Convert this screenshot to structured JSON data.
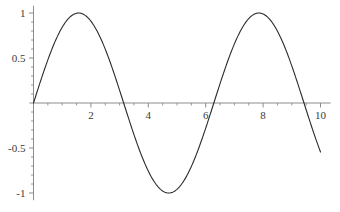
{
  "chart_data": {
    "type": "line",
    "title": "",
    "subtitle": "",
    "xlabel": "",
    "ylabel": "",
    "function": "sin(x)",
    "grid": false,
    "legend": false,
    "legend_position": "none",
    "axis_style": "crossing-at-origin",
    "xlim": [
      0,
      10.35
    ],
    "ylim": [
      -1.08,
      1.08
    ],
    "x_major_ticks": [
      2,
      4,
      6,
      8,
      10
    ],
    "x_major_tick_labels": [
      "2",
      "4",
      "6",
      "8",
      "10"
    ],
    "x_minor_tick_step": 0.5,
    "y_major_ticks": [
      1,
      0.5,
      -0.5,
      -1
    ],
    "y_major_tick_labels": [
      "1",
      "0.5",
      "-0.5",
      "-1"
    ],
    "y_minor_tick_step": 0.1,
    "series": [
      {
        "name": "sin(x)",
        "color": "#2b2b2b",
        "line_width": 1.1,
        "x": [
          0.0,
          0.2,
          0.4,
          0.6,
          0.8,
          1.0,
          1.2,
          1.4,
          1.5708,
          1.8,
          2.0,
          2.2,
          2.4,
          2.6,
          2.8,
          3.0,
          3.1416,
          3.4,
          3.6,
          3.8,
          4.0,
          4.2,
          4.4,
          4.6,
          4.7124,
          5.0,
          5.2,
          5.4,
          5.6,
          5.8,
          6.0,
          6.2832,
          6.5,
          6.7,
          6.9,
          7.1,
          7.3,
          7.5,
          7.7,
          7.854,
          8.1,
          8.3,
          8.5,
          8.7,
          8.9,
          9.1,
          9.3,
          9.4248,
          9.6,
          9.8,
          10.0
        ],
        "y": [
          0.0,
          0.199,
          0.389,
          0.565,
          0.717,
          0.841,
          0.932,
          0.985,
          1.0,
          0.974,
          0.909,
          0.808,
          0.675,
          0.516,
          0.335,
          0.141,
          0.0,
          -0.256,
          -0.443,
          -0.612,
          -0.757,
          -0.872,
          -0.952,
          -0.994,
          -1.0,
          -0.959,
          -0.883,
          -0.773,
          -0.631,
          -0.465,
          -0.279,
          0.0,
          0.215,
          0.405,
          0.579,
          0.729,
          0.851,
          0.938,
          0.989,
          1.0,
          0.97,
          0.897,
          0.798,
          0.664,
          0.501,
          0.319,
          0.125,
          0.0,
          -0.174,
          -0.366,
          -0.544
        ]
      }
    ]
  },
  "axes": {
    "line_color": "#808080",
    "tick_color": "#808080",
    "label_color": "#3a3a3a",
    "background": "#ffffff"
  },
  "labels": {
    "x": [
      {
        "text": "2",
        "value": 2
      },
      {
        "text": "4",
        "value": 4
      },
      {
        "text": "6",
        "value": 6
      },
      {
        "text": "8",
        "value": 8
      },
      {
        "text": "10",
        "value": 10
      }
    ],
    "y": [
      {
        "text": "1",
        "value": 1
      },
      {
        "text": "0.5",
        "value": 0.5
      },
      {
        "text": "-0.5",
        "value": -0.5
      },
      {
        "text": "-1",
        "value": -1
      }
    ]
  }
}
